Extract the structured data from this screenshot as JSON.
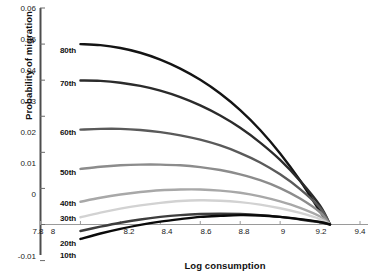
{
  "chart_data": {
    "type": "line",
    "title": "",
    "xlabel": "Log consumption",
    "ylabel": "Probability of migration",
    "xlim": [
      7.8,
      9.4
    ],
    "ylim": [
      -0.01,
      0.06
    ],
    "xticks": [
      "7.8",
      "8",
      "8.2",
      "8.4",
      "8.6",
      "8.8",
      "9",
      "9.2",
      "9.4"
    ],
    "yticks": [
      "0.06",
      "0.05",
      "0.04",
      "0.03",
      "0.02",
      "0.01",
      "0",
      "-0.01"
    ],
    "grid": false,
    "legend_position": "inline-left-of-curves",
    "x_domain_of_curves": [
      8.0,
      9.25
    ],
    "x": [
      8.0,
      8.1,
      8.2,
      8.3,
      8.4,
      8.5,
      8.6,
      8.7,
      8.8,
      8.9,
      9.0,
      9.1,
      9.2,
      9.25
    ],
    "series": [
      {
        "name": "80th",
        "color": "#141414",
        "values": [
          0.05,
          0.0497,
          0.0489,
          0.0476,
          0.0457,
          0.0432,
          0.0401,
          0.0363,
          0.0317,
          0.0262,
          0.0197,
          0.0122,
          0.0036,
          0.0
        ]
      },
      {
        "name": "70th",
        "color": "#2b2b2b",
        "values": [
          0.0399,
          0.0398,
          0.0393,
          0.0384,
          0.0371,
          0.0353,
          0.033,
          0.0302,
          0.0268,
          0.0227,
          0.0179,
          0.0121,
          0.0052,
          0.0
        ]
      },
      {
        "name": "60th",
        "color": "#5a5a5a",
        "values": [
          0.0263,
          0.0265,
          0.0265,
          0.0262,
          0.0256,
          0.0247,
          0.0235,
          0.0219,
          0.0198,
          0.0172,
          0.0139,
          0.0098,
          0.0046,
          0.0
        ]
      },
      {
        "name": "50th",
        "color": "#8c8c8c",
        "values": [
          0.0154,
          0.016,
          0.0164,
          0.0166,
          0.0166,
          0.0164,
          0.0159,
          0.0151,
          0.0139,
          0.0123,
          0.0101,
          0.0072,
          0.0034,
          0.0
        ]
      },
      {
        "name": "40th",
        "color": "#a8a8a8",
        "values": [
          0.0063,
          0.0074,
          0.0083,
          0.009,
          0.0095,
          0.0097,
          0.0097,
          0.0094,
          0.0088,
          0.0078,
          0.0064,
          0.0046,
          0.0022,
          0.0
        ]
      },
      {
        "name": "30th",
        "color": "#d2d2d2",
        "values": [
          0.002,
          0.0033,
          0.0044,
          0.0053,
          0.006,
          0.0065,
          0.0067,
          0.0066,
          0.0062,
          0.0055,
          0.0045,
          0.0032,
          0.0015,
          0.0
        ]
      },
      {
        "name": "20th",
        "color": "#3d3d3d",
        "values": [
          -0.0018,
          -0.0006,
          0.0005,
          0.0014,
          0.0021,
          0.0026,
          0.0029,
          0.003,
          0.0029,
          0.0026,
          0.0021,
          0.0014,
          0.0006,
          0.0
        ]
      },
      {
        "name": "10th",
        "color": "#0a0a0a",
        "values": [
          -0.004,
          -0.0025,
          -0.0012,
          -0.0001,
          0.0008,
          0.0015,
          0.0021,
          0.0024,
          0.0026,
          0.0025,
          0.0021,
          0.0015,
          0.0007,
          0.0
        ]
      }
    ],
    "series_labels": [
      {
        "name": "80th",
        "x_px": 60,
        "y_px": 46
      },
      {
        "name": "70th",
        "x_px": 60,
        "y_px": 79
      },
      {
        "name": "60th",
        "x_px": 60,
        "y_px": 128
      },
      {
        "name": "50th",
        "x_px": 60,
        "y_px": 168
      },
      {
        "name": "40th",
        "x_px": 60,
        "y_px": 199
      },
      {
        "name": "30th",
        "x_px": 60,
        "y_px": 214
      },
      {
        "name": "20th",
        "x_px": 60,
        "y_px": 239
      },
      {
        "name": "10th",
        "x_px": 60,
        "y_px": 251
      }
    ]
  },
  "footer": {
    "cut_text": ""
  }
}
